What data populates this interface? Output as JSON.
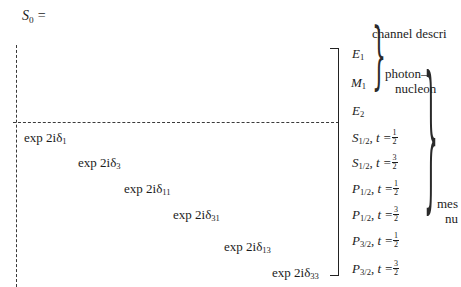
{
  "equation": {
    "lhs": "S",
    "lhs_subscript": "0",
    "equals": "=",
    "lhs_full": "S₀ ="
  },
  "matrix": {
    "left_edge_style": "dashed-vertical-line",
    "right_edge_style": "square-bracket",
    "partition_style": "dashed-horizontal-line",
    "upper_block_entries": [],
    "diagonal_entries": [
      {
        "prefix": "exp 2iδ",
        "subscript": "1"
      },
      {
        "prefix": "exp 2iδ",
        "subscript": "3"
      },
      {
        "prefix": "exp 2iδ",
        "subscript": "11"
      },
      {
        "prefix": "exp 2iδ",
        "subscript": "31"
      },
      {
        "prefix": "exp 2iδ",
        "subscript": "13"
      },
      {
        "prefix": "exp 2iδ",
        "subscript": "33"
      }
    ]
  },
  "channel_description": {
    "header": "channel descri",
    "header_truncated": true,
    "photon_nucleon": {
      "rows": [
        {
          "symbol": "E",
          "subscript": "1"
        },
        {
          "symbol": "M",
          "subscript": "1"
        },
        {
          "symbol": "E",
          "subscript": "2"
        }
      ],
      "label_line1": "photon–",
      "label_line2": "nucleon"
    },
    "meson_nucleon": {
      "rows": [
        {
          "symbol": "S",
          "subscript": "1/2",
          "t_label": "t =",
          "t_num": "1",
          "t_den": "2"
        },
        {
          "symbol": "S",
          "subscript": "1/2",
          "t_label": "t =",
          "t_num": "3",
          "t_den": "2"
        },
        {
          "symbol": "P",
          "subscript": "1/2",
          "t_label": "t =",
          "t_num": "1",
          "t_den": "2"
        },
        {
          "symbol": "P",
          "subscript": "1/2",
          "t_label": "t =",
          "t_num": "3",
          "t_den": "2"
        },
        {
          "symbol": "P",
          "subscript": "3/2",
          "t_label": "t =",
          "t_num": "1",
          "t_den": "2"
        },
        {
          "symbol": "P",
          "subscript": "3/2",
          "t_label": "t =",
          "t_num": "3",
          "t_den": "2"
        }
      ],
      "label_line1": "mes",
      "label_line2": "nu",
      "label_truncated": true
    }
  },
  "colors": {
    "ink": "#1c1c1c",
    "rule": "#3a3a3a",
    "background": "#ffffff"
  }
}
